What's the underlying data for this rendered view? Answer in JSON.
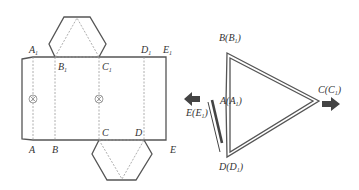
{
  "figure": {
    "net": {
      "top_labels": [
        {
          "letter": "A",
          "sub": "1"
        },
        {
          "letter": "B",
          "sub": "1"
        },
        {
          "letter": "C",
          "sub": "1"
        },
        {
          "letter": "D",
          "sub": "1"
        },
        {
          "letter": "E",
          "sub": "1"
        }
      ],
      "bottom_labels": [
        "A",
        "B",
        "C",
        "D",
        "E"
      ],
      "marker_symbol": "⊗"
    },
    "folded": {
      "labels": [
        {
          "letter": "B",
          "paren": "B",
          "sub": "1"
        },
        {
          "letter": "A",
          "paren": "A",
          "sub": "1"
        },
        {
          "letter": "C",
          "paren": "C",
          "sub": "1"
        },
        {
          "letter": "E",
          "paren": "E",
          "sub": "1"
        },
        {
          "letter": "D",
          "paren": "D",
          "sub": "1"
        }
      ],
      "arrows": [
        "arrow-left",
        "arrow-right"
      ]
    }
  }
}
